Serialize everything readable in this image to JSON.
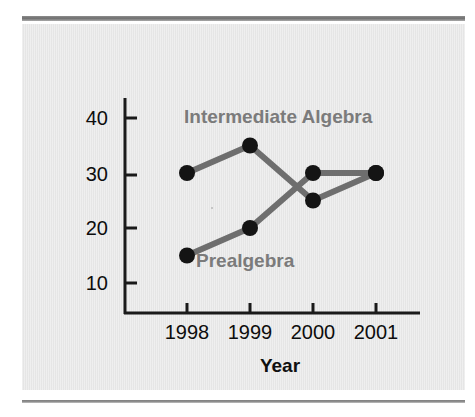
{
  "figure": {
    "panel_color": "#e8e8e8",
    "axis_color": "#1a1a1a",
    "series_color": "#6e6e6e",
    "marker_color": "#141414",
    "label_color": "#7b7b7b"
  },
  "chart_data": {
    "type": "line",
    "title": "",
    "xlabel": "Year",
    "ylabel": "Number of Sections",
    "categories": [
      "1998",
      "1999",
      "2000",
      "2001"
    ],
    "yticks": [
      10,
      20,
      30,
      40
    ],
    "ylim": [
      0,
      45
    ],
    "grid": false,
    "legend_position": "inline-annotations",
    "series": [
      {
        "name": "Intermediate Algebra",
        "values": [
          30,
          35,
          25,
          30
        ],
        "annotation": "Intermediate Algebra"
      },
      {
        "name": "Prealgebra",
        "values": [
          15,
          20,
          30,
          30
        ],
        "annotation": "Prealgebra"
      }
    ]
  },
  "axes": {
    "y_title": "Number of Sections",
    "x_title": "Year",
    "y_tick_labels": [
      "40",
      "30",
      "20",
      "10"
    ],
    "x_tick_labels": [
      "1998",
      "1999",
      "2000",
      "2001"
    ]
  },
  "annotations": {
    "upper_series_label": "Intermediate Algebra",
    "lower_series_label": "Prealgebra"
  }
}
